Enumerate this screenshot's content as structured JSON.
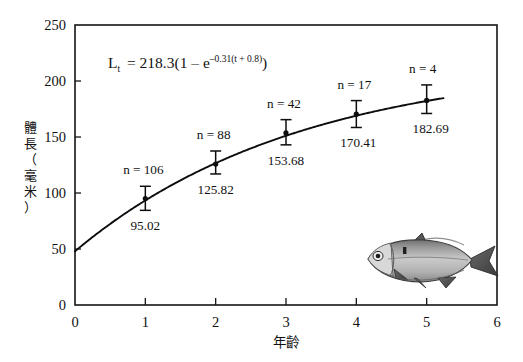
{
  "chart_data": {
    "type": "line",
    "title": "",
    "subtitle": "",
    "xlabel": "年齡",
    "ylabel": "體長（毫米）",
    "ylabel_chars": [
      "體",
      "長",
      "（",
      "毫",
      "米",
      "）"
    ],
    "xlim": [
      0,
      6
    ],
    "ylim": [
      0,
      250
    ],
    "xticks": [
      0,
      1,
      2,
      3,
      4,
      5,
      6
    ],
    "xtick_labels": [
      "0",
      "1",
      "2",
      "3",
      "4",
      "5",
      "6"
    ],
    "yticks": [
      0,
      50,
      100,
      150,
      200,
      250
    ],
    "ytick_labels": [
      "0",
      "50",
      "100",
      "150",
      "200",
      "250"
    ],
    "grid": false,
    "legend": "none",
    "x": [
      1,
      2,
      3,
      4,
      5
    ],
    "values": [
      95.02,
      125.82,
      153.68,
      170.41,
      182.69
    ],
    "value_labels": [
      "95.02",
      "125.82",
      "153.68",
      "170.41",
      "182.69"
    ],
    "sample_sizes": [
      106,
      88,
      42,
      17,
      4
    ],
    "n_labels": [
      "n = 106",
      "n = 88",
      "n = 42",
      "n = 17",
      "n = 4"
    ],
    "error_low": [
      84.5,
      117.0,
      143.0,
      158.5,
      171.0
    ],
    "error_high": [
      106.0,
      137.5,
      165.5,
      182.5,
      196.5
    ],
    "series": [
      {
        "name": "von Bertalanffy fitted curve",
        "equation_plain": "Lt = 218.3(1 - e^(-0.31(t + 0.8)))",
        "L_infinity": 218.3,
        "k": 0.31,
        "t0": -0.8
      }
    ],
    "annotations": {
      "equation": {
        "lhs_base": "L",
        "lhs_sub": "t",
        "eq": "= 218.3(1 – e",
        "exp_main": "–0.31(t + 0.8)",
        "tail": ")"
      }
    },
    "image": {
      "name": "fish-illustration",
      "description": "grayscale drawing of a herring-like fish facing left",
      "body_color": "#b9b9b9",
      "fin_color": "#4a4a4a"
    }
  },
  "axis_titles": {
    "x": "年齡",
    "y": "體長（毫米）"
  }
}
